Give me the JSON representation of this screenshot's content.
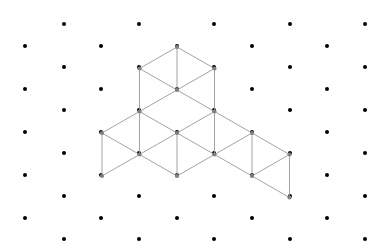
{
  "figure": {
    "background_color": "#ffffff",
    "edge_color": "#999999",
    "vertex_color": "#808080",
    "grid_dot_color": "#000000",
    "edge_width": 0.9,
    "vertex_radius": 2.1,
    "grid_dot_radius": 2.0
  },
  "projection": {
    "origin_x": 177,
    "origin_y": 133,
    "axis_x": [
      37.5,
      21.5
    ],
    "axis_y": [
      -37.5,
      21.5
    ],
    "axis_z": [
      0,
      -43
    ]
  },
  "grid": {
    "columns_x": [
      25,
      64,
      101,
      139,
      177,
      214,
      252,
      290,
      327,
      365
    ],
    "rows_even_y": [
      46,
      89,
      132,
      175,
      218
    ],
    "rows_odd_y": [
      24,
      67,
      110,
      153,
      196,
      239
    ],
    "spacing_x": 37.6,
    "spacing_y": 43,
    "dot_count": 53
  },
  "chart_data": {
    "type": "scatter",
    "xlabel": "",
    "ylabel": "",
    "cubes": [
      {
        "name": "top-cube",
        "cell": [
          0,
          0,
          1
        ],
        "anchor_px": [
          177,
          90
        ]
      },
      {
        "name": "left-cube",
        "cell": [
          0,
          1,
          0
        ],
        "anchor_px": [
          139,
          154
        ]
      },
      {
        "name": "right-cube-near",
        "cell": [
          1,
          0,
          0
        ],
        "anchor_px": [
          215,
          154
        ]
      },
      {
        "name": "right-cube-far",
        "cell": [
          2,
          0,
          0
        ],
        "anchor_px": [
          252,
          176
        ]
      }
    ],
    "cube_count": 4,
    "visible_vertex_count": 22
  }
}
